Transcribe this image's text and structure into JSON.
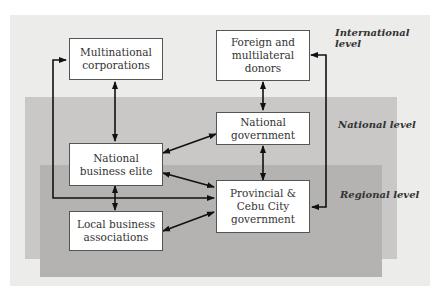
{
  "diagram": {
    "levels": {
      "international": "International level",
      "national": "National level",
      "regional": "Regional level"
    },
    "nodes": {
      "multinational": "Multinational\ncorporations",
      "donors": "Foreign and\nmultilateral\ndonors",
      "national_gov": "National\ngovernment",
      "business_elite": "National\nbusiness elite",
      "provincial": "Provincial &\nCebu City\ngovernment",
      "local_assoc": "Local business\nassociations"
    },
    "colors": {
      "international_bg": "#ececea",
      "national_bg": "#c9c8c6",
      "regional_bg": "#b4b3b1",
      "box_bg": "#ffffff",
      "arrow": "#111111"
    },
    "edges": [
      {
        "from": "multinational",
        "to": "business_elite",
        "type": "bidirectional"
      },
      {
        "from": "donors",
        "to": "national_gov",
        "type": "bidirectional"
      },
      {
        "from": "national_gov",
        "to": "provincial",
        "type": "bidirectional"
      },
      {
        "from": "business_elite",
        "to": "national_gov",
        "type": "bidirectional"
      },
      {
        "from": "business_elite",
        "to": "provincial",
        "type": "bidirectional"
      },
      {
        "from": "business_elite",
        "to": "local_assoc",
        "type": "bidirectional"
      },
      {
        "from": "local_assoc",
        "to": "provincial",
        "type": "bidirectional"
      },
      {
        "from": "multinational",
        "to": "provincial",
        "type": "bidirectional-loop-left"
      },
      {
        "from": "donors",
        "to": "provincial",
        "type": "bidirectional-loop-right"
      }
    ]
  }
}
